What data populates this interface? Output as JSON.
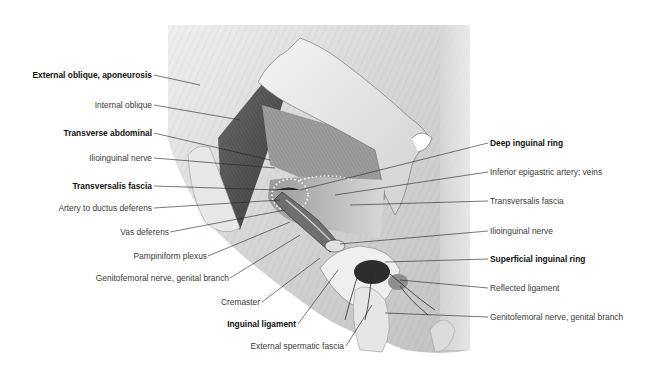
{
  "figure": {
    "colors": {
      "background": "#ffffff",
      "label_bold": "#111111",
      "label_regular": "#3a3a3a",
      "leader_line": "#222222",
      "tissue_light": "#e6e6e6",
      "tissue_mid": "#b9b9b9",
      "muscle_dark": "#5e5e5e",
      "cavity_dark": "#2b2b2b"
    }
  },
  "labels": {
    "left": [
      {
        "text": "External oblique, aponeurosis",
        "bold": true
      },
      {
        "text": "Internal oblique",
        "bold": false
      },
      {
        "text": "Transverse abdominal",
        "bold": true
      },
      {
        "text": "Ilioinguinal nerve",
        "bold": false
      },
      {
        "text": "Transversalis fascia",
        "bold": true
      },
      {
        "text": "Artery to ductus deferens",
        "bold": false
      },
      {
        "text": "Vas deferens",
        "bold": false
      },
      {
        "text": "Pampiniform plexus",
        "bold": false
      },
      {
        "text": "Genitofemoral nerve, genital branch",
        "bold": false
      },
      {
        "text": "Cremaster",
        "bold": false
      },
      {
        "text": "Inguinal ligament",
        "bold": true
      },
      {
        "text": "External spermatic fascia",
        "bold": false
      }
    ],
    "right": [
      {
        "text": "Deep inguinal ring",
        "bold": true
      },
      {
        "text": "Inferior epigastric artery; veins",
        "bold": false
      },
      {
        "text": "Transversalis fascia",
        "bold": false
      },
      {
        "text": "Ilioinguinal nerve",
        "bold": false
      },
      {
        "text": "Superficial inguinal ring",
        "bold": true
      },
      {
        "text": "Reflected ligament",
        "bold": false
      },
      {
        "text": "Genitofemoral nerve, genital branch",
        "bold": false
      }
    ]
  }
}
